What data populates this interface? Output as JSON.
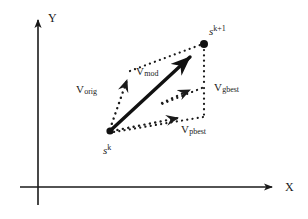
{
  "figure": {
    "kind": "vector-diagram",
    "background_color": "#ffffff",
    "ink_color": "#1a1a1a",
    "axes": {
      "y_label": "Y",
      "x_label": "X",
      "origin": [
        38,
        187
      ],
      "y_tip": [
        38,
        16
      ],
      "x_tip": [
        278,
        187
      ],
      "x_start": [
        20,
        187
      ],
      "y_start": [
        38,
        205
      ]
    },
    "points": [
      {
        "name": "current-position",
        "label_base": "s",
        "label_sup": "k",
        "coords": [
          110,
          130
        ],
        "label_pos": [
          103,
          146
        ]
      },
      {
        "name": "next-position",
        "label_base": "s",
        "label_sup": "k+1",
        "coords": [
          204,
          44
        ],
        "label_pos": [
          209,
          26
        ]
      }
    ],
    "vectors": [
      {
        "name": "v-orig",
        "label_base": "V",
        "label_sub": "orig",
        "style": "dotted",
        "from": [
          110,
          130
        ],
        "to": [
          129,
          74
        ],
        "label_pos": [
          76,
          86
        ]
      },
      {
        "name": "v-mod",
        "label_base": "V",
        "label_sub": "mod",
        "style": "solid-thick",
        "from": [
          110,
          130
        ],
        "to": [
          204,
          44
        ],
        "label_pos": [
          136,
          68
        ]
      },
      {
        "name": "v-pbest",
        "label_base": "V",
        "label_sub": "pbest",
        "style": "dotted",
        "from": [
          110,
          130
        ],
        "to": [
          191,
          114
        ],
        "label_pos": [
          182,
          126
        ]
      },
      {
        "name": "v-gbest",
        "label_base": "V",
        "label_sub": "gbest",
        "style": "dotted",
        "from": [
          160,
          104
        ],
        "to": [
          204,
          84
        ],
        "label_pos": [
          214,
          84
        ]
      }
    ],
    "construction_lines": [
      {
        "name": "orig-to-tip",
        "from": [
          129,
          72
        ],
        "to": [
          203,
          44
        ]
      },
      {
        "name": "tip-vertical-upper",
        "from": [
          204,
          48
        ],
        "to": [
          204,
          86
        ]
      },
      {
        "name": "tip-vertical-lower",
        "from": [
          204,
          86
        ],
        "to": [
          204,
          116
        ]
      },
      {
        "name": "gbest-close",
        "from": [
          204,
          86
        ],
        "to": [
          160,
          104
        ]
      },
      {
        "name": "pbest-close",
        "from": [
          204,
          116
        ],
        "to": [
          112,
          132
        ]
      }
    ]
  }
}
